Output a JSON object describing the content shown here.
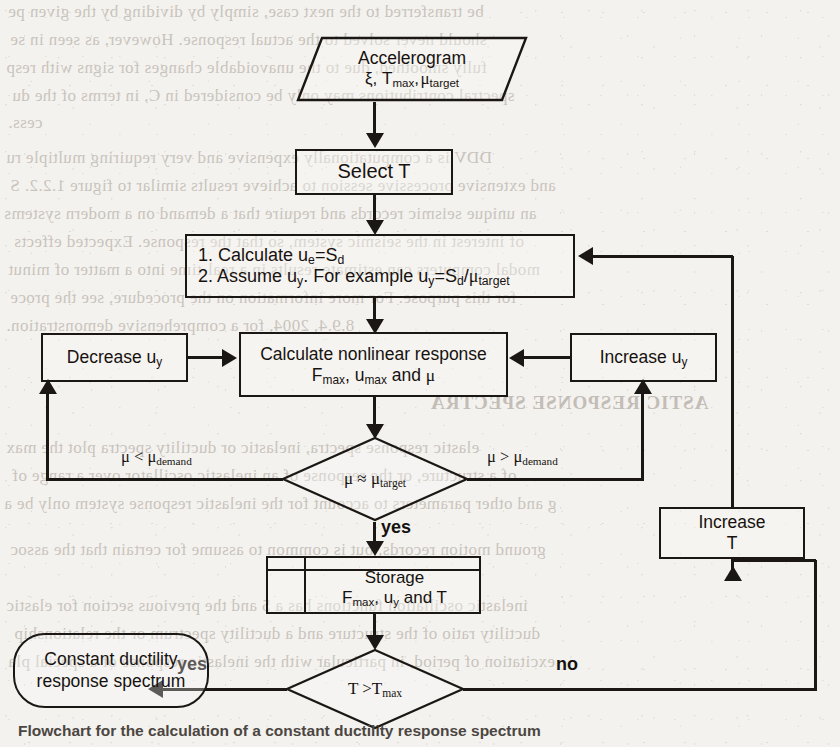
{
  "document": {
    "kind": "scanned-book-page-figure",
    "caption": "Flowchart for the calculation of a constant ductility response spectrum"
  },
  "flowchart": {
    "title": "Constant ductility response spectrum procedure",
    "nodes": {
      "input": {
        "shape": "parallelogram",
        "line1": "Accelerogram",
        "line2_parts": [
          "ξ, ",
          "T",
          "max",
          ", ",
          "μ",
          "target"
        ],
        "line2_plain": "ξ, Tmax, μtarget"
      },
      "select_t": {
        "shape": "rectangle",
        "label": "Select T"
      },
      "initialize": {
        "shape": "rectangle",
        "line1": "1. Calculate u",
        "line1_sub": "e",
        "line1_rest": "=S",
        "line1_sub2": "d",
        "line1_plain": "1. Calculate ue=Sd",
        "line2_plain": "2. Assume uy. For example uy=Sd/μtarget"
      },
      "nonlinear": {
        "shape": "rectangle",
        "line1": "Calculate nonlinear response",
        "line2_plain": "Fmax, umax and μ"
      },
      "decrease_uy": {
        "shape": "rectangle",
        "label_plain": "Decrease uy"
      },
      "increase_uy": {
        "shape": "rectangle",
        "label_plain": "Increase uy"
      },
      "mu_decision": {
        "shape": "diamond",
        "label_plain": "μ ≈ μtarget"
      },
      "storage": {
        "shape": "stored-data",
        "line1": "Storage",
        "line2_plain": "Fmax, uy and T"
      },
      "increase_t": {
        "shape": "rectangle",
        "line1": "Increase",
        "line2": "T"
      },
      "t_decision": {
        "shape": "diamond",
        "label_plain": "T >Tmax"
      },
      "terminal": {
        "shape": "stadium",
        "line1": "Constant ductility",
        "line2": "response spectrum"
      }
    },
    "edge_labels": {
      "mu_less": "μ < μdemand",
      "mu_greater": "μ > μdemand",
      "mu_yes": "yes",
      "t_yes": "yes",
      "t_no": "no"
    },
    "colors": {
      "ink": "#1b1714",
      "paper": "#f4f2ef",
      "ghost": "#b9b2aa"
    }
  },
  "ghost_text": {
    "lines": [
      "be transferred to the next case, simply by dividing by the given pe",
      "should never solved to the actual response. However, as seen in se",
      "fully smoothed, due to the unavoidable changes for signs with resp",
      "spectral contributions may only be considered in C, in terms of the du",
      "cess.",
      "DDV is a computationally expensive and very requiring multiple ru",
      "and extensive processive session to achieve results similar to figure 1.2.2. S",
      "an unique seismic records and require that a demand on a modern systems",
      "of interest in the seismic system, so that the response. Expected effects",
      "modal computers can estimate results in a real-time into a matter of minut",
      "for this purpose. For more information on the procedure, see the proce",
      "8.9.4, 2004, for a comprehensive demonstration.",
      "ASTIC RESPONSE SPECTRA",
      "elastic response spectra, inelastic or ductility spectra plot the max",
      "of a structure, or the response of an inelastic oscillator over a range of",
      "g and other parameters to account for the inelastic response system only be a",
      "ground motion records, but is common to assume for certain that the assoc",
      "inelastic oscillation functions has a 5 and the previous section for elastic",
      "ductility ratio of the structure and a ductility spectrum or the relationship",
      "excitation of period, in particular with the inelastic response of a special pla"
    ]
  }
}
